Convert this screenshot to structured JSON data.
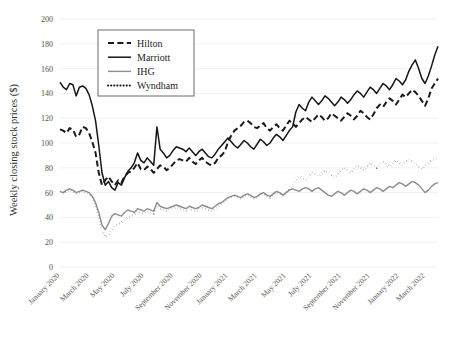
{
  "chart_data": {
    "type": "line",
    "title": "",
    "xlabel": "",
    "ylabel": "Weekly closing stock prices ($)",
    "ylim": [
      0,
      200
    ],
    "ytick_values": [
      0,
      20,
      40,
      60,
      80,
      100,
      120,
      140,
      160,
      180,
      200
    ],
    "ytick_labels": [
      "0",
      "20",
      "40",
      "60",
      "80",
      "100",
      "120",
      "140",
      "160",
      "180",
      "200"
    ],
    "grid": true,
    "grid_axis": "y",
    "legend_position": "upper-left-inset",
    "x_axis_kind": "date-weekly",
    "x_start": "January 2020",
    "x_end": "March 2022",
    "xtick_labels": [
      "January 2020",
      "March 2020",
      "May 2020",
      "July 2020",
      "September 2020",
      "November 2020",
      "January 2021",
      "March 2021",
      "May 2021",
      "July 2021",
      "September 2021",
      "November 2021",
      "January 2022",
      "March 2022"
    ],
    "xtick_positions": [
      0,
      9,
      17,
      26,
      35,
      44,
      52,
      61,
      70,
      78,
      87,
      96,
      105,
      113
    ],
    "n_points": 118,
    "series": [
      {
        "name": "Hilton",
        "color": "#1a1a1a",
        "dash": "dashed",
        "width": 2.0,
        "values": [
          111,
          110,
          108,
          112,
          111,
          105,
          107,
          113,
          112,
          108,
          101,
          92,
          76,
          66,
          70,
          73,
          69,
          66,
          70,
          68,
          73,
          76,
          77,
          80,
          84,
          79,
          78,
          81,
          79,
          76,
          79,
          82,
          81,
          78,
          80,
          83,
          86,
          87,
          86,
          85,
          88,
          85,
          83,
          86,
          88,
          85,
          83,
          82,
          84,
          88,
          90,
          93,
          101,
          106,
          110,
          112,
          114,
          117,
          118,
          116,
          113,
          112,
          114,
          116,
          112,
          110,
          113,
          115,
          112,
          110,
          114,
          118,
          116,
          113,
          116,
          119,
          121,
          119,
          117,
          120,
          123,
          121,
          118,
          120,
          124,
          122,
          120,
          118,
          121,
          124,
          122,
          119,
          122,
          126,
          124,
          121,
          119,
          123,
          128,
          131,
          129,
          133,
          136,
          134,
          131,
          135,
          139,
          137,
          140,
          143,
          141,
          138,
          134,
          130,
          136,
          144,
          148,
          152
        ]
      },
      {
        "name": "Marriott",
        "color": "#161616",
        "dash": "solid",
        "width": 1.5,
        "values": [
          149,
          145,
          143,
          148,
          147,
          138,
          145,
          146,
          144,
          139,
          130,
          118,
          98,
          76,
          66,
          69,
          64,
          62,
          68,
          66,
          72,
          77,
          80,
          84,
          92,
          86,
          84,
          88,
          85,
          82,
          113,
          95,
          92,
          88,
          90,
          94,
          97,
          96,
          95,
          93,
          96,
          93,
          90,
          93,
          95,
          92,
          89,
          88,
          91,
          95,
          98,
          101,
          104,
          101,
          98,
          96,
          99,
          102,
          100,
          97,
          95,
          99,
          103,
          101,
          98,
          100,
          104,
          107,
          105,
          102,
          106,
          110,
          113,
          125,
          131,
          128,
          126,
          133,
          137,
          134,
          131,
          134,
          138,
          136,
          133,
          130,
          133,
          137,
          135,
          132,
          135,
          139,
          142,
          140,
          137,
          141,
          145,
          143,
          140,
          144,
          148,
          146,
          143,
          147,
          152,
          150,
          147,
          151,
          158,
          163,
          167,
          160,
          152,
          148,
          154,
          162,
          171,
          178
        ]
      },
      {
        "name": "IHG",
        "color": "#8e8e8e",
        "dash": "solid",
        "width": 1.4,
        "values": [
          61,
          60,
          62,
          63,
          62,
          60,
          61,
          62,
          61,
          60,
          57,
          52,
          44,
          34,
          30,
          35,
          41,
          43,
          42,
          41,
          44,
          46,
          45,
          44,
          47,
          46,
          45,
          47,
          46,
          45,
          52,
          49,
          48,
          47,
          48,
          49,
          50,
          49,
          48,
          47,
          49,
          48,
          47,
          48,
          50,
          49,
          48,
          47,
          49,
          51,
          52,
          54,
          56,
          57,
          58,
          57,
          56,
          58,
          59,
          58,
          56,
          57,
          59,
          60,
          58,
          57,
          59,
          61,
          60,
          58,
          60,
          62,
          63,
          62,
          61,
          63,
          64,
          63,
          61,
          63,
          64,
          62,
          60,
          58,
          57,
          59,
          61,
          60,
          58,
          60,
          62,
          61,
          59,
          61,
          63,
          62,
          60,
          62,
          64,
          63,
          61,
          63,
          65,
          64,
          66,
          68,
          67,
          65,
          67,
          69,
          68,
          66,
          63,
          60,
          62,
          65,
          67,
          68
        ]
      },
      {
        "name": "Wyndham",
        "color": "#161616",
        "dash": "dotted",
        "width": 2.0,
        "values": [
          60,
          59,
          61,
          62,
          61,
          59,
          60,
          61,
          60,
          59,
          56,
          50,
          41,
          30,
          24,
          26,
          30,
          33,
          35,
          36,
          38,
          40,
          41,
          42,
          45,
          44,
          43,
          45,
          44,
          43,
          49,
          47,
          46,
          45,
          46,
          47,
          48,
          47,
          46,
          45,
          47,
          46,
          45,
          46,
          48,
          47,
          46,
          45,
          47,
          49,
          51,
          53,
          55,
          56,
          57,
          56,
          55,
          57,
          58,
          57,
          55,
          56,
          58,
          59,
          57,
          56,
          58,
          60,
          59,
          57,
          60,
          63,
          66,
          70,
          73,
          72,
          70,
          73,
          76,
          75,
          73,
          75,
          78,
          76,
          74,
          72,
          75,
          78,
          80,
          78,
          76,
          79,
          82,
          80,
          78,
          81,
          84,
          82,
          80,
          83,
          85,
          83,
          81,
          84,
          86,
          84,
          82,
          85,
          87,
          85,
          83,
          81,
          79,
          82,
          84,
          86,
          87,
          88
        ]
      }
    ]
  },
  "legend": {
    "items": [
      {
        "label": "Hilton"
      },
      {
        "label": "Marriott"
      },
      {
        "label": "IHG"
      },
      {
        "label": "Wyndham"
      }
    ]
  },
  "axes": {
    "y_title": "Weekly closing stock prices ($)"
  },
  "colors": {
    "grid": "#ececeb",
    "hilton": "#1a1a1a",
    "marriott": "#161616",
    "ihg": "#8e8e8e",
    "wyndham": "#161616",
    "tick_text": "#50504e",
    "legend_border": "#5b5b5b"
  }
}
